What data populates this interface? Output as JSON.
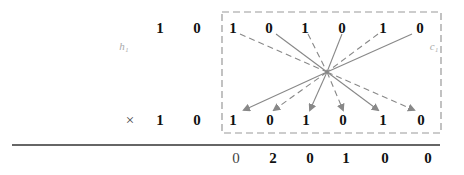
{
  "diagram": {
    "title": "",
    "multiplicand": {
      "left_digits": [
        "1",
        "0"
      ],
      "box_digits": [
        "1",
        "0",
        "1",
        "0",
        "1",
        "0"
      ]
    },
    "multiplier": {
      "operator": "×",
      "left_digits": [
        "1",
        "0"
      ],
      "box_digits": [
        "1",
        "0",
        "1",
        "0",
        "1",
        "0"
      ]
    },
    "result_digits": [
      "0",
      "2",
      "0",
      "1",
      "0",
      "0"
    ],
    "left_label": "h₁",
    "right_label": "c₁",
    "connections": {
      "top_line_styles": [
        "dashed",
        "solid",
        "dashed",
        "solid",
        "dashed",
        "solid"
      ],
      "bottom_arrow_styles": [
        "solid",
        "dashed",
        "solid",
        "dashed",
        "solid",
        "dashed"
      ],
      "convergence_point": [
        327,
        72
      ]
    },
    "colors": {
      "digit": "#111111",
      "line": "#888888",
      "box_border": "#999999",
      "rule": "#333333"
    }
  }
}
